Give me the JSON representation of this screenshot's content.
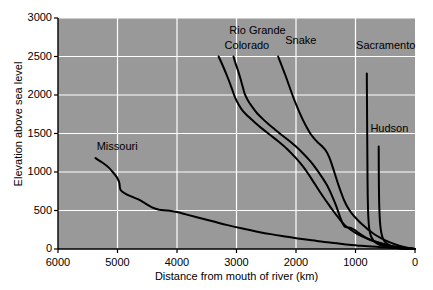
{
  "chart_data": {
    "type": "line",
    "title": "",
    "xlabel": "Distance from mouth of river (km)",
    "ylabel": "Elevation above sea level",
    "xlim": [
      6000,
      0
    ],
    "ylim": [
      0,
      3000
    ],
    "x_ticks": [
      "6000",
      "5000",
      "4000",
      "3000",
      "2000",
      "1000",
      "0"
    ],
    "x_tick_values": [
      6000,
      5000,
      4000,
      3000,
      2000,
      1000,
      0
    ],
    "y_ticks": [
      "0",
      "500",
      "1000",
      "1500",
      "2000",
      "2500",
      "3000"
    ],
    "y_tick_values": [
      0,
      500,
      1000,
      1500,
      2000,
      2500,
      3000
    ],
    "x_axis_reversed": true,
    "grid": true,
    "grid_color": "#ffffff",
    "plot_background": "#999999",
    "line_color": "#000000",
    "legend_position": "inline-labels",
    "series": [
      {
        "name": "Missouri",
        "label_x": 5350,
        "label_y": 1320,
        "points": [
          [
            5370,
            1180
          ],
          [
            5250,
            1120
          ],
          [
            5150,
            1060
          ],
          [
            5080,
            1000
          ],
          [
            5010,
            930
          ],
          [
            4970,
            860
          ],
          [
            4950,
            770
          ],
          [
            4870,
            720
          ],
          [
            4760,
            680
          ],
          [
            4640,
            640
          ],
          [
            4530,
            590
          ],
          [
            4420,
            540
          ],
          [
            4300,
            510
          ],
          [
            4150,
            500
          ],
          [
            4000,
            480
          ],
          [
            3850,
            450
          ],
          [
            3650,
            410
          ],
          [
            3400,
            360
          ],
          [
            3150,
            310
          ],
          [
            2900,
            265
          ],
          [
            2650,
            225
          ],
          [
            2400,
            190
          ],
          [
            2150,
            160
          ],
          [
            1900,
            130
          ],
          [
            1650,
            105
          ],
          [
            1400,
            80
          ],
          [
            1150,
            60
          ],
          [
            900,
            42
          ],
          [
            650,
            28
          ],
          [
            400,
            16
          ],
          [
            200,
            8
          ],
          [
            0,
            0
          ]
        ]
      },
      {
        "name": "Colorado",
        "label_x": 3200,
        "label_y": 2640,
        "points": [
          [
            3300,
            2500
          ],
          [
            3230,
            2380
          ],
          [
            3160,
            2250
          ],
          [
            3090,
            2110
          ],
          [
            3030,
            1980
          ],
          [
            2960,
            1870
          ],
          [
            2890,
            1790
          ],
          [
            2800,
            1720
          ],
          [
            2700,
            1650
          ],
          [
            2580,
            1570
          ],
          [
            2450,
            1490
          ],
          [
            2300,
            1400
          ],
          [
            2150,
            1300
          ],
          [
            2000,
            1180
          ],
          [
            1880,
            1070
          ],
          [
            1780,
            960
          ],
          [
            1680,
            840
          ],
          [
            1580,
            720
          ],
          [
            1480,
            610
          ],
          [
            1380,
            500
          ],
          [
            1280,
            400
          ],
          [
            1180,
            310
          ],
          [
            1080,
            250
          ],
          [
            980,
            200
          ],
          [
            880,
            160
          ],
          [
            760,
            120
          ],
          [
            640,
            85
          ],
          [
            520,
            58
          ],
          [
            400,
            38
          ],
          [
            280,
            22
          ],
          [
            150,
            10
          ],
          [
            0,
            0
          ]
        ]
      },
      {
        "name": "Rio Grande",
        "label_x": 3120,
        "label_y": 2830,
        "points": [
          [
            3050,
            2500
          ],
          [
            3020,
            2420
          ],
          [
            2980,
            2330
          ],
          [
            2940,
            2230
          ],
          [
            2900,
            2120
          ],
          [
            2860,
            2010
          ],
          [
            2800,
            1920
          ],
          [
            2730,
            1840
          ],
          [
            2650,
            1760
          ],
          [
            2560,
            1690
          ],
          [
            2460,
            1620
          ],
          [
            2350,
            1550
          ],
          [
            2240,
            1480
          ],
          [
            2120,
            1410
          ],
          [
            2000,
            1330
          ],
          [
            1880,
            1240
          ],
          [
            1760,
            1140
          ],
          [
            1660,
            1040
          ],
          [
            1570,
            940
          ],
          [
            1480,
            830
          ],
          [
            1400,
            700
          ],
          [
            1330,
            570
          ],
          [
            1270,
            440
          ],
          [
            1220,
            340
          ],
          [
            1180,
            290
          ],
          [
            1130,
            280
          ],
          [
            1080,
            275
          ],
          [
            1020,
            250
          ],
          [
            950,
            210
          ],
          [
            860,
            165
          ],
          [
            760,
            125
          ],
          [
            640,
            90
          ],
          [
            500,
            58
          ],
          [
            360,
            34
          ],
          [
            200,
            14
          ],
          [
            0,
            0
          ]
        ]
      },
      {
        "name": "Snake",
        "label_x": 2180,
        "label_y": 2700,
        "points": [
          [
            2300,
            2500
          ],
          [
            2240,
            2380
          ],
          [
            2180,
            2260
          ],
          [
            2120,
            2130
          ],
          [
            2060,
            2000
          ],
          [
            2000,
            1880
          ],
          [
            1940,
            1770
          ],
          [
            1880,
            1670
          ],
          [
            1820,
            1580
          ],
          [
            1760,
            1500
          ],
          [
            1700,
            1440
          ],
          [
            1640,
            1390
          ],
          [
            1570,
            1340
          ],
          [
            1500,
            1280
          ],
          [
            1440,
            1190
          ],
          [
            1390,
            1080
          ],
          [
            1340,
            960
          ],
          [
            1290,
            840
          ],
          [
            1240,
            730
          ],
          [
            1190,
            630
          ],
          [
            1130,
            540
          ],
          [
            1060,
            460
          ],
          [
            980,
            390
          ],
          [
            890,
            320
          ],
          [
            790,
            255
          ],
          [
            690,
            195
          ],
          [
            580,
            145
          ],
          [
            460,
            100
          ],
          [
            340,
            62
          ],
          [
            220,
            32
          ],
          [
            110,
            12
          ],
          [
            0,
            0
          ]
        ]
      },
      {
        "name": "Sacramento",
        "label_x": 990,
        "label_y": 2640,
        "points": [
          [
            810,
            2280
          ],
          [
            808,
            2050
          ],
          [
            806,
            1820
          ],
          [
            804,
            1590
          ],
          [
            802,
            1360
          ],
          [
            800,
            1130
          ],
          [
            798,
            910
          ],
          [
            795,
            700
          ],
          [
            790,
            520
          ],
          [
            782,
            380
          ],
          [
            770,
            270
          ],
          [
            750,
            190
          ],
          [
            720,
            135
          ],
          [
            680,
            95
          ],
          [
            620,
            65
          ],
          [
            540,
            42
          ],
          [
            440,
            25
          ],
          [
            320,
            13
          ],
          [
            180,
            5
          ],
          [
            0,
            0
          ]
        ]
      },
      {
        "name": "Hudson",
        "label_x": 750,
        "label_y": 1560,
        "points": [
          [
            610,
            1330
          ],
          [
            609,
            1140
          ],
          [
            608,
            960
          ],
          [
            606,
            790
          ],
          [
            603,
            630
          ],
          [
            598,
            490
          ],
          [
            590,
            370
          ],
          [
            578,
            270
          ],
          [
            562,
            195
          ],
          [
            540,
            140
          ],
          [
            512,
            100
          ],
          [
            475,
            70
          ],
          [
            430,
            48
          ],
          [
            370,
            30
          ],
          [
            300,
            17
          ],
          [
            210,
            8
          ],
          [
            110,
            3
          ],
          [
            0,
            0
          ]
        ]
      }
    ]
  },
  "axis": {
    "ylabel_text": "Elevation above sea level",
    "xlabel_text": "Distance from mouth of river (km)"
  }
}
